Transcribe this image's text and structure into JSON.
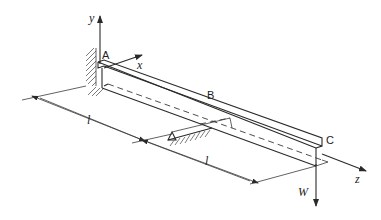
{
  "figure": {
    "points": {
      "A": "A",
      "B": "B",
      "C": "C"
    },
    "axes": {
      "x": "x",
      "y": "y",
      "z": "z"
    },
    "dimensions": {
      "span_AB": "l",
      "span_BC": "l"
    },
    "load": {
      "label": "W",
      "direction": "down"
    },
    "colors": {
      "ink": "#2a2a2a",
      "background": "#ffffff"
    }
  }
}
